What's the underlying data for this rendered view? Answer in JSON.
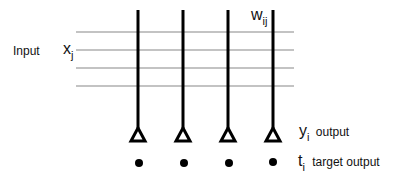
{
  "diagram": {
    "labels": {
      "input": "Input",
      "x_var": "x",
      "x_sub": "j",
      "w_var": "w",
      "w_sub": "ij",
      "y_var": "y",
      "y_sub": "i",
      "output": "output",
      "t_var": "t",
      "t_sub": "i",
      "target_output": "target output"
    },
    "input_lines": [
      32,
      50,
      68,
      86
    ],
    "output_columns": [
      138,
      183,
      228,
      273
    ],
    "colors": {
      "input_line": "#888888",
      "column": "#000000",
      "background": "#ffffff"
    }
  }
}
